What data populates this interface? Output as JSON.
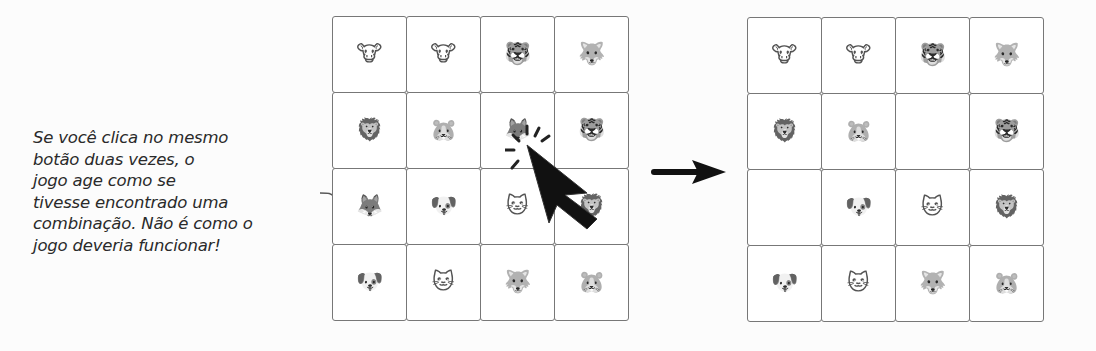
{
  "annotation": {
    "lines": [
      "Se você clica no mesmo",
      "botão duas vezes, o",
      "jogo age como se",
      "tivesse encontrado uma",
      "combinação. Não é como o",
      "jogo deveria funcionar!"
    ]
  },
  "left_grid": {
    "label": "before",
    "cells": [
      {
        "animal": "cow",
        "glyph": "🐮"
      },
      {
        "animal": "cow",
        "glyph": "🐮"
      },
      {
        "animal": "tiger",
        "glyph": "🐯"
      },
      {
        "animal": "wolf",
        "glyph": "🐺"
      },
      {
        "animal": "lion",
        "glyph": "🦁"
      },
      {
        "animal": "hamster",
        "glyph": "🐹"
      },
      {
        "animal": "fox",
        "glyph": "🦊",
        "clicked": true
      },
      {
        "animal": "tiger",
        "glyph": "🐯"
      },
      {
        "animal": "fox",
        "glyph": "🦊"
      },
      {
        "animal": "dog",
        "glyph": "🐶"
      },
      {
        "animal": "cat",
        "glyph": "🐱"
      },
      {
        "animal": "lion",
        "glyph": "🦁"
      },
      {
        "animal": "dog",
        "glyph": "🐶"
      },
      {
        "animal": "cat",
        "glyph": "🐱"
      },
      {
        "animal": "wolf",
        "glyph": "🐺"
      },
      {
        "animal": "hamster",
        "glyph": "🐹"
      }
    ]
  },
  "right_grid": {
    "label": "after",
    "cells": [
      {
        "animal": "cow",
        "glyph": "🐮"
      },
      {
        "animal": "cow",
        "glyph": "🐮"
      },
      {
        "animal": "tiger",
        "glyph": "🐯"
      },
      {
        "animal": "wolf",
        "glyph": "🐺"
      },
      {
        "animal": "lion",
        "glyph": "🦁"
      },
      {
        "animal": "hamster",
        "glyph": "🐹"
      },
      {
        "animal": "empty",
        "glyph": ""
      },
      {
        "animal": "tiger",
        "glyph": "🐯"
      },
      {
        "animal": "empty",
        "glyph": ""
      },
      {
        "animal": "dog",
        "glyph": "🐶"
      },
      {
        "animal": "cat",
        "glyph": "🐱"
      },
      {
        "animal": "lion",
        "glyph": "🦁"
      },
      {
        "animal": "dog",
        "glyph": "🐶"
      },
      {
        "animal": "cat",
        "glyph": "🐱"
      },
      {
        "animal": "wolf",
        "glyph": "🐺"
      },
      {
        "animal": "hamster",
        "glyph": "🐹"
      }
    ]
  },
  "icons": {
    "arrow": "right-arrow-icon",
    "cursor": "mouse-cursor-click-icon"
  }
}
